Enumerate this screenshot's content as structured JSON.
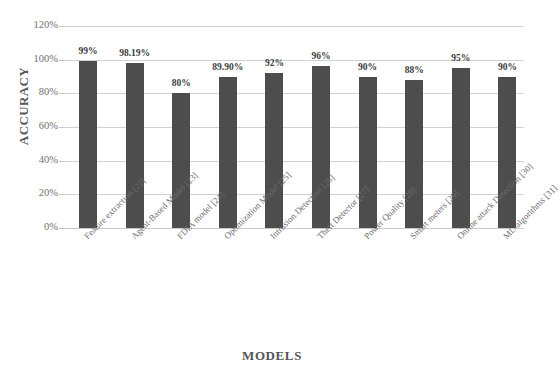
{
  "chart_data": {
    "type": "bar",
    "title": "",
    "xlabel": "MODELS",
    "ylabel": "ACCURACY",
    "ylim": [
      0,
      120
    ],
    "ytick_step": 20,
    "ytick_labels": [
      "0%",
      "20%",
      "40%",
      "60%",
      "80%",
      "100%",
      "120%"
    ],
    "grid": true,
    "legend": false,
    "bar_color": "#4d4d4d",
    "gridline_color": "#d2d2d2",
    "categories": [
      "Feature extraction [22]",
      "Agent-Based Model [23]",
      "FDIA model [24]",
      "Optimization Model [25]",
      "Intrusion Detection [26]",
      "Theft Detector [27]",
      "Power Quality [28]",
      "Smart meters [29]",
      "Online attack Detection [30]",
      "ML-algorithms [31]"
    ],
    "values": [
      99,
      98.19,
      80,
      89.9,
      92,
      96,
      90,
      88,
      95,
      90
    ],
    "value_labels": [
      "99%",
      "98.19%",
      "80%",
      "89.90%",
      "92%",
      "96%",
      "90%",
      "88%",
      "95%",
      "90%"
    ]
  }
}
